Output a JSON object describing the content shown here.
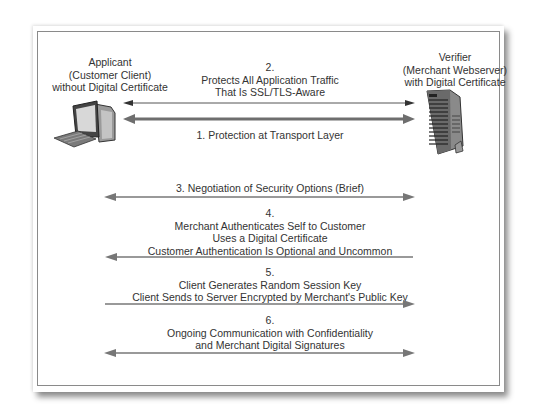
{
  "applicant": {
    "line1": "Applicant",
    "line2": "(Customer Client)",
    "line3": "without Digital Certificate",
    "icon": "desktop-computer-icon"
  },
  "verifier": {
    "line1": "Verifier",
    "line2": "(Merchant Webserver)",
    "line3": "with Digital Certificate",
    "icon": "server-tower-icon"
  },
  "steps": [
    {
      "number": "1.",
      "text": "1. Protection at Transport Layer",
      "direction": "both",
      "style": "thick"
    },
    {
      "number": "2.",
      "lines": [
        "2.",
        "Protects All Application Traffic",
        "That Is SSL/TLS-Aware"
      ],
      "direction": "both",
      "style": "thin"
    },
    {
      "number": "3.",
      "text": "3. Negotiation of Security Options (Brief)",
      "direction": "both"
    },
    {
      "number": "4.",
      "lines": [
        "4.",
        "Merchant Authenticates Self to Customer",
        "Uses a Digital Certificate",
        "Customer Authentication Is Optional and Uncommon"
      ],
      "direction": "to-client"
    },
    {
      "number": "5.",
      "lines": [
        "5.",
        "Client Generates Random Session Key",
        "Client Sends to Server Encrypted by Merchant's Public Key"
      ],
      "direction": "to-server"
    },
    {
      "number": "6.",
      "lines": [
        "6.",
        "Ongoing Communication with Confidentiality",
        "and Merchant Digital Signatures"
      ],
      "direction": "both"
    }
  ],
  "colors": {
    "arrow": "#6e6e6e",
    "frame": "#8a8a8a",
    "text": "#333333"
  }
}
